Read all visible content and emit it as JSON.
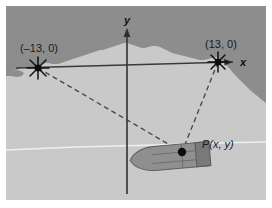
{
  "figure": {
    "kind": "coastal-navigation-diagram",
    "colors": {
      "land": "#8d8d8d",
      "water": "#c9c9c9",
      "axis": "#3a3a3a",
      "dashed": "#4a4a4a",
      "boat_hull": "#8f8f8f",
      "boat_stern": "#7a7a7a",
      "wave_line": "#f2f2f2",
      "label": "#1a1a1a",
      "background": "#ffffff"
    }
  },
  "axes": {
    "x_label": "x",
    "y_label": "y"
  },
  "stations": [
    {
      "id": "left-station",
      "label": "(–13, 0)",
      "x_value": -13,
      "y_value": 0,
      "marker": "starburst-marker"
    },
    {
      "id": "right-station",
      "label": "(13, 0)",
      "x_value": 13,
      "y_value": 0,
      "marker": "starburst-marker"
    }
  ],
  "ship": {
    "label": "P(x, y)",
    "marker": "dot-marker",
    "icon": "boat-icon"
  },
  "paths": [
    {
      "id": "left-range-line",
      "from": "(–13, 0)",
      "to": "P(x, y)",
      "style": "dashed"
    },
    {
      "id": "right-range-line",
      "from": "(13, 0)",
      "to": "P(x, y)",
      "style": "dashed"
    }
  ]
}
